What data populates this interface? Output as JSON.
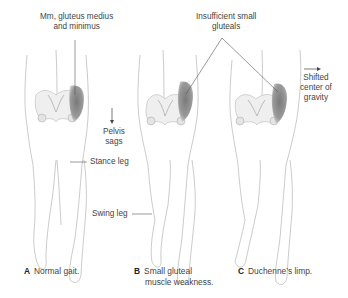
{
  "labels": {
    "muscles": [
      "Mm, gluteus medius",
      "and minimus"
    ],
    "insufficient": [
      "Insufficient small",
      "gluteals"
    ],
    "pelvis_sags": [
      "Pelvis",
      "sags"
    ],
    "shifted_center": [
      "Shifted",
      "center of",
      "gravity"
    ],
    "stance_leg": "Stance leg",
    "swing_leg": "Swing leg"
  },
  "captions": [
    {
      "letter": "A",
      "lines": [
        "Normal gait."
      ]
    },
    {
      "letter": "B",
      "lines": [
        "Small gluteal",
        "muscle weakness."
      ]
    },
    {
      "letter": "C",
      "lines": [
        "Duchenne’s limp."
      ]
    }
  ],
  "colors": {
    "muscle_shade": "#8a8a8a",
    "outline": "#9a9a9a",
    "bone": "#c8c8c8",
    "text": "#444444"
  }
}
